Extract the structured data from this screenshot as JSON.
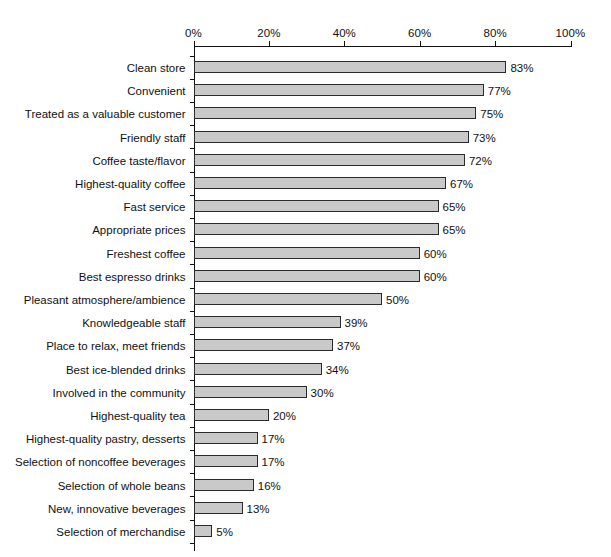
{
  "chart_data": {
    "type": "bar",
    "orientation": "horizontal",
    "title": "",
    "subtitle": "",
    "xlabel": "",
    "ylabel": "",
    "xlim": [
      0,
      100
    ],
    "grid": false,
    "legend": null,
    "axis_position": "top",
    "value_label_suffix": "%",
    "tick_labels": [
      "0%",
      "20%",
      "40%",
      "60%",
      "80%",
      "100%"
    ],
    "ticks": [
      0,
      20,
      40,
      60,
      80,
      100
    ],
    "categories": [
      "Clean store",
      "Convenient",
      "Treated as a valuable customer",
      "Friendly staff",
      "Coffee taste/flavor",
      "Highest-quality coffee",
      "Fast service",
      "Appropriate prices",
      "Freshest coffee",
      "Best espresso drinks",
      "Pleasant atmosphere/ambience",
      "Knowledgeable staff",
      "Place to relax, meet friends",
      "Best ice-blended drinks",
      "Involved in the community",
      "Highest-quality tea",
      "Highest-quality pastry, desserts",
      "Selection of noncoffee beverages",
      "Selection of whole beans",
      "New, innovative beverages",
      "Selection of merchandise"
    ],
    "values": [
      83,
      77,
      75,
      73,
      72,
      67,
      65,
      65,
      60,
      60,
      50,
      39,
      37,
      34,
      30,
      20,
      17,
      17,
      16,
      13,
      5
    ],
    "data_labels": [
      "83%",
      "77%",
      "75%",
      "73%",
      "72%",
      "67%",
      "65%",
      "65%",
      "60%",
      "60%",
      "50%",
      "39%",
      "37%",
      "34%",
      "30%",
      "20%",
      "17%",
      "17%",
      "16%",
      "13%",
      "5%"
    ],
    "colors": {
      "bar_fill": "#c9c9c9",
      "bar_border": "#2b2b2b",
      "axis": "#111111",
      "text": "#111111",
      "background": "#ffffff"
    }
  }
}
